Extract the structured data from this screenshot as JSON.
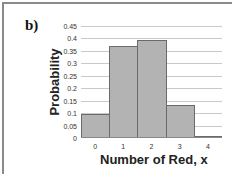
{
  "panel_label": "b)",
  "chart_data": {
    "type": "bar",
    "title": "",
    "xlabel": "Number of Red, x",
    "ylabel": "Probability",
    "categories": [
      "0",
      "1",
      "2",
      "3",
      "4"
    ],
    "values": [
      0.095,
      0.37,
      0.395,
      0.133,
      0.01
    ],
    "ylim": [
      0,
      0.45
    ],
    "yticks": [
      "0",
      "0.05",
      "0.1",
      "0.15",
      "0.2",
      "0.25",
      "0.3",
      "0.35",
      "0.4",
      "0.45"
    ],
    "grid": true,
    "legend": null,
    "bar_color": "#b3b3b3",
    "bar_edge_color": "#6b6b6b",
    "bar_gap": 0
  }
}
